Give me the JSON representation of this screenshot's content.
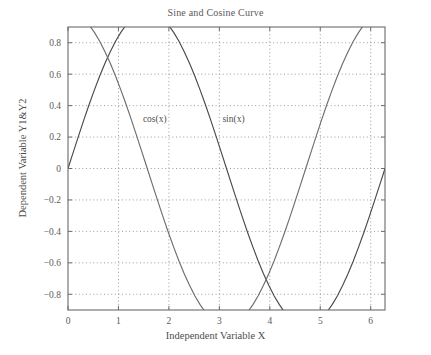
{
  "chart_data": {
    "type": "line",
    "title": "Sine and Cosine Curve",
    "xlabel": "Independent Variable X",
    "ylabel": "Dependent Variable Y1&Y2",
    "xlim": [
      0,
      6.2832
    ],
    "ylim": [
      -0.9,
      0.9
    ],
    "xticks": [
      0,
      1,
      2,
      3,
      4,
      5,
      6
    ],
    "xtick_labels": [
      "0",
      "1",
      "2",
      "3",
      "4",
      "5",
      "6"
    ],
    "yticks": [
      -0.8,
      -0.6,
      -0.4,
      -0.2,
      0,
      0.2,
      0.4,
      0.6,
      0.8
    ],
    "ytick_labels": [
      "−0.8",
      "−0.6",
      "−0.4",
      "−0.2",
      "0",
      "0.2",
      "0.4",
      "0.6",
      "0.8"
    ],
    "grid": true,
    "grid_style": "dotted",
    "legend_position": "inline-annotations",
    "annotations": [
      {
        "text": "cos(x)",
        "x": 1.72,
        "y": 0.295
      },
      {
        "text": "sin(x)",
        "x": 3.28,
        "y": 0.295
      }
    ],
    "series": [
      {
        "name": "sin(x)",
        "color": "#4a4a4c",
        "label": "sin(x)",
        "x": [
          0,
          0.1047,
          0.2094,
          0.3142,
          0.4189,
          0.5236,
          0.6283,
          0.733,
          0.8378,
          0.9425,
          1.0472,
          1.1519,
          1.2566,
          1.3614,
          1.4661,
          1.5708,
          1.6755,
          1.7802,
          1.885,
          1.9897,
          2.0944,
          2.1991,
          2.3038,
          2.4086,
          2.5133,
          2.618,
          2.7227,
          2.8274,
          2.9322,
          3.0369,
          3.1416,
          3.2463,
          3.351,
          3.4558,
          3.5605,
          3.6652,
          3.7699,
          3.8746,
          3.9794,
          4.0841,
          4.1888,
          4.2935,
          4.3982,
          4.5029,
          4.6077,
          4.7124,
          4.8171,
          4.9218,
          5.0265,
          5.1313,
          5.236,
          5.3407,
          5.4454,
          5.5501,
          5.6549,
          5.7596,
          5.8643,
          5.969,
          6.0737,
          6.1785,
          6.2832
        ],
        "y": [
          0,
          0.1045,
          0.2079,
          0.309,
          0.4067,
          0.5,
          0.5878,
          0.6691,
          0.7431,
          0.809,
          0.866,
          0.9135,
          0.9511,
          0.9781,
          0.9945,
          1,
          0.9945,
          0.9781,
          0.9511,
          0.9135,
          0.866,
          0.809,
          0.7431,
          0.6691,
          0.5878,
          0.5,
          0.4067,
          0.309,
          0.2079,
          0.1045,
          0,
          -0.1045,
          -0.2079,
          -0.309,
          -0.4067,
          -0.5,
          -0.5878,
          -0.6691,
          -0.7431,
          -0.809,
          -0.866,
          -0.9135,
          -0.9511,
          -0.9781,
          -0.9945,
          -1,
          -0.9945,
          -0.9781,
          -0.9511,
          -0.9135,
          -0.866,
          -0.809,
          -0.7431,
          -0.6691,
          -0.5878,
          -0.5,
          -0.4067,
          -0.309,
          -0.2079,
          -0.1045,
          0
        ]
      },
      {
        "name": "cos(x)",
        "color": "#6e6e70",
        "label": "cos(x)",
        "x": [
          0,
          0.1047,
          0.2094,
          0.3142,
          0.4189,
          0.5236,
          0.6283,
          0.733,
          0.8378,
          0.9425,
          1.0472,
          1.1519,
          1.2566,
          1.3614,
          1.4661,
          1.5708,
          1.6755,
          1.7802,
          1.885,
          1.9897,
          2.0944,
          2.1991,
          2.3038,
          2.4086,
          2.5133,
          2.618,
          2.7227,
          2.8274,
          2.9322,
          3.0369,
          3.1416,
          3.2463,
          3.351,
          3.4558,
          3.5605,
          3.6652,
          3.7699,
          3.8746,
          3.9794,
          4.0841,
          4.1888,
          4.2935,
          4.3982,
          4.5029,
          4.6077,
          4.7124,
          4.8171,
          4.9218,
          5.0265,
          5.1313,
          5.236,
          5.3407,
          5.4454,
          5.5501,
          5.6549,
          5.7596,
          5.8643,
          5.969,
          6.0737,
          6.1785,
          6.2832
        ],
        "y": [
          1,
          0.9945,
          0.9781,
          0.9511,
          0.9135,
          0.866,
          0.809,
          0.7431,
          0.6691,
          0.5878,
          0.5,
          0.4067,
          0.309,
          0.2079,
          0.1045,
          0,
          -0.1045,
          -0.2079,
          -0.309,
          -0.4067,
          -0.5,
          -0.5878,
          -0.6691,
          -0.7431,
          -0.809,
          -0.866,
          -0.9135,
          -0.9511,
          -0.9781,
          -0.9945,
          -1,
          -0.9945,
          -0.9781,
          -0.9511,
          -0.9135,
          -0.866,
          -0.809,
          -0.7431,
          -0.6691,
          -0.5878,
          -0.5,
          -0.4067,
          -0.309,
          -0.2079,
          -0.1045,
          0,
          0.1045,
          0.2079,
          0.309,
          0.4067,
          0.5,
          0.5878,
          0.6691,
          0.7431,
          0.809,
          0.866,
          0.9135,
          0.9511,
          0.9781,
          0.9945,
          1
        ]
      }
    ]
  },
  "axes": {
    "frame_color": "#6b6b6d",
    "grid_color": "#8f8f92",
    "text_color": "#5a5a5c"
  }
}
